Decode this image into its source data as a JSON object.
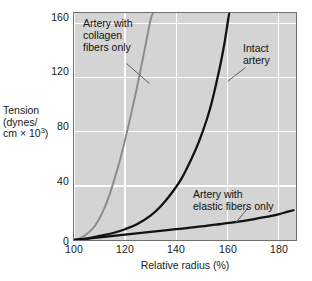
{
  "chart_data": {
    "type": "line",
    "title": "",
    "xlabel": "Relative radius (%)",
    "ylabel": "Tension\n(dynes/\ncm × 10³)",
    "ylabel_line1": "Tension",
    "ylabel_line2": "(dynes/",
    "ylabel_line3_pre": "cm × 10",
    "ylabel_line3_sup": "3",
    "ylabel_line3_post": ")",
    "xlim": [
      100,
      187
    ],
    "ylim": [
      0,
      168
    ],
    "xticks": [
      100,
      120,
      140,
      160,
      180
    ],
    "yticks": [
      0,
      40,
      80,
      120,
      160
    ],
    "xticklabels": [
      "100",
      "120",
      "140",
      "160",
      "180"
    ],
    "yticklabels": [
      "0",
      "40",
      "80",
      "120",
      "160"
    ],
    "grid": true,
    "grid_color": "#ffffff",
    "plot_background": "#d4d4d4",
    "legend": "none",
    "series": [
      {
        "name": "Artery with collagen fibers only",
        "color": "#8c8c8c",
        "width": 2.0,
        "points": [
          [
            100,
            0
          ],
          [
            102,
            1
          ],
          [
            104,
            3
          ],
          [
            106,
            6
          ],
          [
            108,
            10
          ],
          [
            110,
            16
          ],
          [
            112,
            24
          ],
          [
            114,
            34
          ],
          [
            116,
            46
          ],
          [
            118,
            59
          ],
          [
            120,
            74
          ],
          [
            122,
            90
          ],
          [
            124,
            107
          ],
          [
            126,
            125
          ],
          [
            128,
            144
          ],
          [
            130,
            163
          ],
          [
            131,
            168
          ]
        ]
      },
      {
        "name": "Intact artery",
        "color": "#111111",
        "width": 2.3,
        "points": [
          [
            100,
            0
          ],
          [
            105,
            1
          ],
          [
            110,
            3
          ],
          [
            115,
            5
          ],
          [
            120,
            8
          ],
          [
            125,
            12
          ],
          [
            130,
            18
          ],
          [
            134,
            25
          ],
          [
            138,
            34
          ],
          [
            142,
            45
          ],
          [
            146,
            60
          ],
          [
            149,
            73
          ],
          [
            152,
            89
          ],
          [
            154,
            102
          ],
          [
            156,
            118
          ],
          [
            157.5,
            131
          ],
          [
            159,
            146
          ],
          [
            160,
            158
          ],
          [
            160.8,
            168
          ]
        ]
      },
      {
        "name": "Artery with elastic fibers only",
        "color": "#111111",
        "width": 2.3,
        "points": [
          [
            100,
            0
          ],
          [
            110,
            2
          ],
          [
            120,
            4
          ],
          [
            130,
            6
          ],
          [
            140,
            8
          ],
          [
            150,
            10
          ],
          [
            158,
            12
          ],
          [
            166,
            14
          ],
          [
            172,
            16
          ],
          [
            178,
            18
          ],
          [
            182,
            20
          ],
          [
            186,
            22
          ]
        ]
      }
    ],
    "annotations": [
      {
        "id": "collagen",
        "text": "Artery with\ncollagen\nfibers only",
        "leader": {
          "from": [
            126,
            63
          ],
          "to": [
            149,
            83
          ]
        }
      },
      {
        "id": "intact",
        "text": "Intact\nartery",
        "leader": {
          "from": [
            246,
            67
          ],
          "to": [
            228,
            81
          ]
        }
      },
      {
        "id": "elastic",
        "text": "Artery with\nelastic fibers only",
        "leader": {
          "from": [
            249,
            208
          ],
          "to": [
            236,
            224
          ]
        }
      }
    ]
  },
  "axes": {
    "y_labels": [
      "160",
      "120",
      "80",
      "40",
      "0"
    ],
    "x_labels": [
      "100",
      "120",
      "140",
      "160",
      "180"
    ],
    "x_title": "Relative radius (%)"
  },
  "annotations": {
    "collagen": "Artery with\ncollagen\nfibers only",
    "intact": "Intact\nartery",
    "elastic": "Artery with\nelastic fibers only"
  },
  "colors": {
    "panel": "#d4d4d4",
    "grid": "#ffffff",
    "collagen_curve": "#8c8c8c",
    "black_curve": "#111111",
    "frame": "#6e6e6e",
    "text": "#1a1a1a"
  }
}
